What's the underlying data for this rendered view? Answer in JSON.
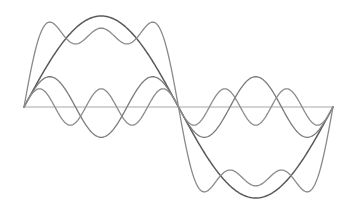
{
  "figure": {
    "width": 350,
    "height": 211,
    "background": "#ffffff"
  },
  "axis": {
    "x_start_px": 24,
    "x_end_px": 333,
    "y_px": 107,
    "color": "#a8a8a8"
  },
  "plot": {
    "domain": [
      0,
      6.283185
    ],
    "amplitude_px": 91,
    "samples": 240
  },
  "curves": [
    {
      "name": "fundamental-sin-x",
      "terms": [
        [
          1,
          1
        ]
      ],
      "color": "#5a5a5a",
      "width": 1.5
    },
    {
      "name": "third-harmonic",
      "terms": [
        [
          3,
          0.3333333
        ]
      ],
      "color": "#7a7a7a",
      "width": 1.3
    },
    {
      "name": "fifth-harmonic",
      "terms": [
        [
          5,
          0.2
        ]
      ],
      "color": "#8c8c8c",
      "width": 1.3
    },
    {
      "name": "partial-sum-square-wave",
      "terms": [
        [
          1,
          1
        ],
        [
          3,
          0.3333333
        ],
        [
          5,
          0.2
        ]
      ],
      "color": "#8a8a8a",
      "width": 1.3
    }
  ]
}
